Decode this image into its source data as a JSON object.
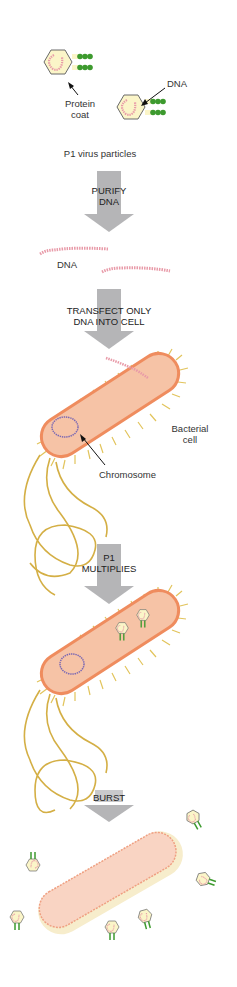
{
  "figure": {
    "colors": {
      "capsid_fill": "#fbf5c8",
      "capsid_stroke": "#6a6a6a",
      "dna_pink": "#e89aa8",
      "tail_green": "#3d9a2e",
      "arrow_gray": "#b5b5b7",
      "cell_body": "#f6c3a6",
      "cell_wall": "#ef8c5e",
      "pili_gold": "#d9b64a",
      "chromosome_purple": "#7a68b3",
      "lysed_cell_shell": "#f7edcc"
    }
  },
  "step1": {
    "label_protein_coat": "Protein\ncoat",
    "label_protein_coat_line1": "Protein",
    "label_protein_coat_line2": "coat",
    "label_dna": "DNA",
    "caption": "P1 virus particles"
  },
  "arrow1": {
    "line1": "PURIFY",
    "line2": "DNA"
  },
  "step2": {
    "label_dna": "DNA"
  },
  "arrow2": {
    "line1": "TRANSFECT ONLY",
    "line2": "DNA INTO CELL"
  },
  "step3": {
    "label_bacterial_line1": "Bacterial",
    "label_bacterial_line2": "cell",
    "label_chromosome": "Chromosome"
  },
  "arrow3": {
    "line1": "P1",
    "line2": "MULTIPLIES"
  },
  "arrow4": {
    "line1": "BURST"
  }
}
